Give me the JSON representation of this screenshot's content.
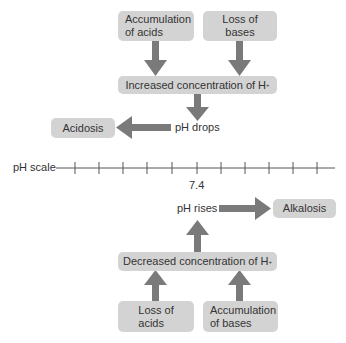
{
  "diagram": {
    "acidosis_path": {
      "causes": [
        {
          "line1": "Accumulation",
          "line2": "of acids"
        },
        {
          "line1": "Loss of",
          "line2": "bases"
        }
      ],
      "effect": "Increased concentration of H",
      "effect_superscript": "+",
      "ph_change": "pH drops",
      "result": "Acidosis"
    },
    "ph_scale": {
      "label": "pH scale",
      "center_value": "7.4",
      "tick_count": 11
    },
    "alkalosis_path": {
      "causes": [
        {
          "line1": "Loss of",
          "line2": "acids"
        },
        {
          "line1": "Accumulation",
          "line2": "of bases"
        }
      ],
      "effect": "Decreased concentration of H",
      "effect_superscript": "+",
      "ph_change": "pH rises",
      "result": "Alkalosis"
    },
    "colors": {
      "box_fill": "#d3d3d3",
      "arrow": "#7a7a7a",
      "text": "#333333",
      "scale_line": "#555555"
    }
  }
}
